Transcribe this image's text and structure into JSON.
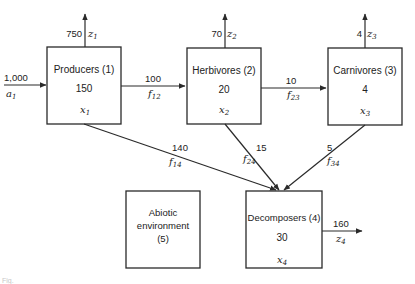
{
  "diagram": {
    "type": "compartment-flow-model",
    "compartments": [
      {
        "id": 1,
        "name": "Producers",
        "label": "Producers (1)",
        "value": "150",
        "var": "x",
        "var_sub": "1"
      },
      {
        "id": 2,
        "name": "Herbivores",
        "label": "Herbivores (2)",
        "value": "20",
        "var": "x",
        "var_sub": "2"
      },
      {
        "id": 3,
        "name": "Carnivores",
        "label": "Carnivores (3)",
        "value": "4",
        "var": "x",
        "var_sub": "3"
      },
      {
        "id": 4,
        "name": "Decomposers",
        "label": "Decomposers (4)",
        "value": "30",
        "var": "x",
        "var_sub": "4"
      },
      {
        "id": 5,
        "name": "Abiotic environment",
        "label_line1": "Abiotic",
        "label_line2": "environment",
        "label_line3": "(5)"
      }
    ],
    "inputs": [
      {
        "to": 1,
        "value": "1,000",
        "var": "a",
        "var_sub": "1"
      }
    ],
    "outputs": [
      {
        "from": 1,
        "value": "750",
        "var": "z",
        "var_sub": "1"
      },
      {
        "from": 2,
        "value": "70",
        "var": "z",
        "var_sub": "2"
      },
      {
        "from": 3,
        "value": "4",
        "var": "z",
        "var_sub": "3"
      },
      {
        "from": 4,
        "value": "160",
        "var": "z",
        "var_sub": "4"
      }
    ],
    "flows": [
      {
        "from": 1,
        "to": 2,
        "value": "100",
        "var": "f",
        "var_sub": "12"
      },
      {
        "from": 2,
        "to": 3,
        "value": "10",
        "var": "f",
        "var_sub": "23"
      },
      {
        "from": 1,
        "to": 4,
        "value": "140",
        "var": "f",
        "var_sub": "14"
      },
      {
        "from": 2,
        "to": 4,
        "value": "15",
        "var": "f",
        "var_sub": "24"
      },
      {
        "from": 3,
        "to": 4,
        "value": "5",
        "var": "f",
        "var_sub": "34"
      }
    ],
    "caption": "Fig."
  }
}
